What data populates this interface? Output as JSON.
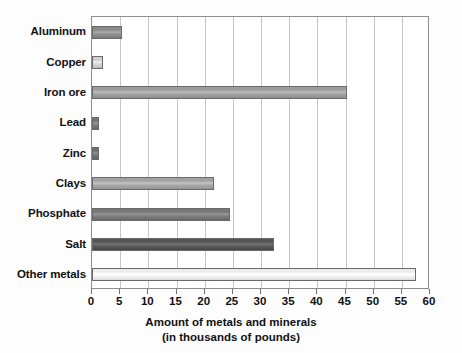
{
  "chart_data": {
    "type": "bar",
    "orientation": "horizontal",
    "title": "",
    "xlabel": "Amount of metals and minerals",
    "xlabel_line2": "(in thousands of pounds)",
    "ylabel": "",
    "xlim": [
      0,
      60
    ],
    "xticks": [
      0,
      5,
      10,
      15,
      20,
      25,
      30,
      35,
      40,
      45,
      50,
      55,
      60
    ],
    "xtick_labels": [
      "0",
      "5",
      "10",
      "15",
      "20",
      "25",
      "30",
      "35",
      "40",
      "45",
      "50",
      "55",
      "60"
    ],
    "grid": "vertical",
    "legend": "none",
    "categories": [
      "Aluminum",
      "Copper",
      "Iron ore",
      "Lead",
      "Zinc",
      "Clays",
      "Phosphate",
      "Salt",
      "Other metals"
    ],
    "values": [
      5.4,
      1.9,
      45.3,
      1.2,
      1.2,
      21.7,
      24.5,
      32.3,
      57.5
    ],
    "bar_colors": [
      "#8a8a8a",
      "#cfcfcf",
      "#9c9c9c",
      "#767676",
      "#6f6f6f",
      "#a2a2a2",
      "#777777",
      "#545454",
      "#ececec"
    ],
    "bar_edge_color": "#6a6a6a",
    "grid_color": "#c6c6c6",
    "frame_color": "#8e8e8e",
    "text_color": "#111111",
    "background": "#ffffff"
  }
}
